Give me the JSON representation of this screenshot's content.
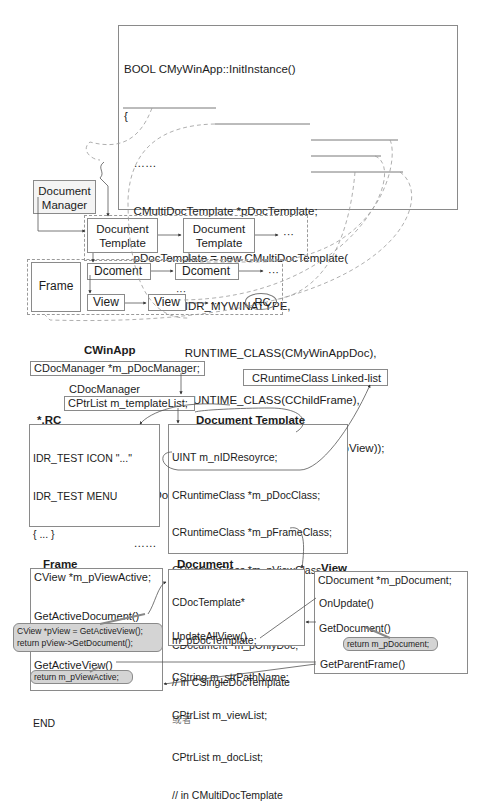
{
  "top_code": {
    "lines": [
      "BOOL CMyWinApp::InitInstance()",
      "{",
      "   ……",
      "   CMultiDocTemplate *pDocTemplate;",
      "   pDocTemplate = new CMultiDocTemplate(",
      "                   IDR_MYWINATYPE,",
      "                   RUNTIME_CLASS(CMyWinAppDoc),",
      "                   RUNTIME_CLASS(CChildFrame),",
      "                   RUNTIME_CLASS(CMyWinAppView));",
      "   AddDocTemplate(pDocTemplate);",
      "   ……"
    ]
  },
  "upper_diagram": {
    "document_manager": "Document\nManager",
    "doc_template_1": "Document\nTemplate",
    "doc_template_2": "Document\nTemplate",
    "ellipsis": "···",
    "frame": "Frame",
    "document_1": "Dcoment",
    "document_2": "Dcoment",
    "view_1": "View",
    "view_2": "View",
    "rc": ".RC"
  },
  "cwinapp": {
    "title": "CWinApp",
    "member": "CDocManager *m_pDocManager;"
  },
  "cdocmanager": {
    "title": "CDocManager",
    "member": "CPtrList m_templateList;"
  },
  "runtime_list": {
    "label": "CRuntimeClass Linked-list"
  },
  "rc_file": {
    "title": "*.RC",
    "lines": [
      "IDR_TEST ICON \"...\"",
      "IDR_TEST MENU",
      "{ ... }",
      "STRINGTABLE",
      "BEGIN",
      " IDR_TEST",
      " \"···\\n···\\n···\\n···\\n...\"",
      "END"
    ]
  },
  "document_template": {
    "title": "Document Template",
    "lines": [
      "UINT m_nIDResoyrce;",
      "CRuntimeClass *m_pDocClass;",
      "CRuntimeClass *m_pFrameClass;",
      "CRuntimeClass *m_pViewClass;",
      "",
      "CDocument *m_pOnlyDoc;",
      "// in CSingleDocTemplate",
      "或者",
      "CPtrList m_docList;",
      "// in CMultiDocTemplate"
    ]
  },
  "frame": {
    "title": "Frame",
    "member": "CView *m_pViewActive;",
    "get_active_document": "GetActiveDocument()",
    "get_active_document_impl": "CView *pView = GetActiveView();\nreturn pView->GetDocument();",
    "get_active_view": "GetActiveView()",
    "get_active_view_impl": "return m_pViewActive;"
  },
  "document": {
    "title": "Document",
    "lines": [
      "CDocTemplate*",
      "m_pDocTemplate;",
      "CString m_strPathName;",
      "CPtrList m_viewList;"
    ],
    "update_all_view": "UpdateAllView()"
  },
  "view": {
    "title": "View",
    "member": "CDocument *m_pDocument;",
    "on_update": "OnUpdate()",
    "get_document": "GetDocument()",
    "get_document_impl": "return m_pDocument;",
    "get_parent_frame": "GetParentFrame()"
  }
}
